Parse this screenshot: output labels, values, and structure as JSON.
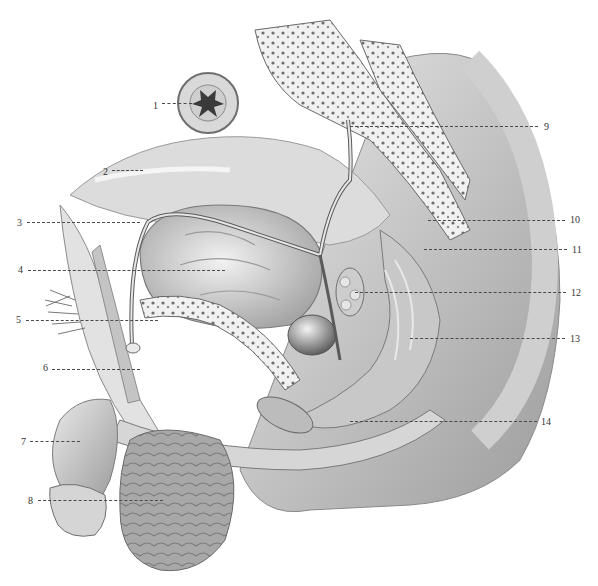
{
  "figure": {
    "type": "anatomical-illustration",
    "style": "grayscale pencil drawing",
    "view": "median sagittal section of male pelvis"
  },
  "callouts": [
    {
      "num": "1",
      "side": "left",
      "label_x": 153,
      "label_y": 101,
      "line_x1": 162,
      "line_x2": 192,
      "line_y": 103
    },
    {
      "num": "2",
      "side": "left",
      "label_x": 103,
      "label_y": 167,
      "line_x1": 112,
      "line_x2": 143,
      "line_y": 170
    },
    {
      "num": "3",
      "side": "left",
      "label_x": 17,
      "label_y": 218,
      "line_x1": 27,
      "line_x2": 140,
      "line_y": 222
    },
    {
      "num": "4",
      "side": "left",
      "label_x": 18,
      "label_y": 265,
      "line_x1": 28,
      "line_x2": 225,
      "line_y": 270
    },
    {
      "num": "5",
      "side": "left",
      "label_x": 16,
      "label_y": 315,
      "line_x1": 26,
      "line_x2": 158,
      "line_y": 320
    },
    {
      "num": "6",
      "side": "left",
      "label_x": 43,
      "label_y": 363,
      "line_x1": 52,
      "line_x2": 140,
      "line_y": 369
    },
    {
      "num": "7",
      "side": "left",
      "label_x": 21,
      "label_y": 437,
      "line_x1": 30,
      "line_x2": 80,
      "line_y": 441
    },
    {
      "num": "8",
      "side": "left",
      "label_x": 28,
      "label_y": 496,
      "line_x1": 38,
      "line_x2": 163,
      "line_y": 500
    },
    {
      "num": "9",
      "side": "right",
      "label_x": 544,
      "label_y": 122,
      "line_x1": 350,
      "line_x2": 538,
      "line_y": 126
    },
    {
      "num": "10",
      "side": "right",
      "label_x": 570,
      "label_y": 215,
      "line_x1": 428,
      "line_x2": 565,
      "line_y": 220
    },
    {
      "num": "11",
      "side": "right",
      "label_x": 572,
      "label_y": 245,
      "line_x1": 424,
      "line_x2": 567,
      "line_y": 249
    },
    {
      "num": "12",
      "side": "right",
      "label_x": 571,
      "label_y": 288,
      "line_x1": 355,
      "line_x2": 566,
      "line_y": 292
    },
    {
      "num": "13",
      "side": "right",
      "label_x": 570,
      "label_y": 334,
      "line_x1": 410,
      "line_x2": 565,
      "line_y": 338
    },
    {
      "num": "14",
      "side": "right",
      "label_x": 541,
      "label_y": 417,
      "line_x1": 350,
      "line_x2": 537,
      "line_y": 421
    }
  ],
  "colors": {
    "background": "#ffffff",
    "leader_line": "#4a4a4a",
    "label_text": "#333333",
    "tissue_light": "#e6e6e6",
    "tissue_mid": "#bdbdbd",
    "tissue_dark": "#6f6f6f",
    "bone_spongy": "#f0f0f0"
  }
}
